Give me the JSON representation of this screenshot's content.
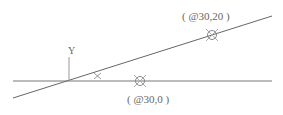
{
  "diagram": {
    "colors": {
      "line": "#666666",
      "marker": "#999999",
      "text": "#666666",
      "background": "#ffffff"
    },
    "axis": {
      "y_label": "Y"
    },
    "x_marker": {
      "label": "×"
    },
    "points": [
      {
        "label": "( @30,20 )"
      },
      {
        "label": "( @30,0 )"
      }
    ]
  }
}
